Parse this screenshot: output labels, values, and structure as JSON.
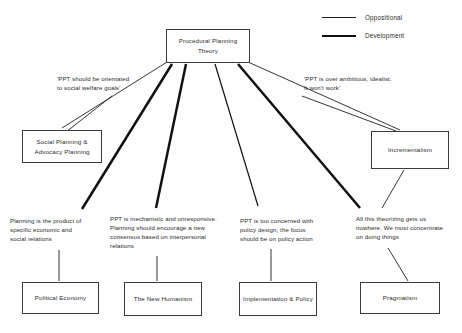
{
  "diagram": {
    "legend": {
      "items": [
        {
          "label": "Oppositional",
          "style": "thin-line",
          "color": "#1f1f1f"
        },
        {
          "label": "Development",
          "style": "thick-line",
          "color": "#111111"
        }
      ]
    },
    "root": {
      "label": "Procedural Planning\nTheory"
    },
    "notes": [
      {
        "id": "note-left",
        "text": "'PPT should be orientated\nto social welfare goals'"
      },
      {
        "id": "note-right",
        "text": "'PPT is over ambitious, idealist.\nIt won't work'"
      }
    ],
    "mid_nodes": [
      {
        "id": "social-planning",
        "label": "Social Planning &\nAdvocacy Planning"
      },
      {
        "id": "incrementalism",
        "label": "Incrementalism"
      }
    ],
    "critiques": [
      {
        "id": "critique-political-economy",
        "text": "Planning is the product of\nspecific economic and\nsocial relations"
      },
      {
        "id": "critique-new-humanism",
        "text": "PPT is mechanistic and unresponsive.\nPlanning should encourage a new\nconsensus based on interpersonal\nrelations"
      },
      {
        "id": "critique-implementation",
        "text": "PPT is too concerned with\npolicy design, the focus\nshould be on policy action"
      },
      {
        "id": "critique-pragmatism",
        "text": "All this theorizing gets us\nnowhere. We must concentrate\non doing things"
      }
    ],
    "outcomes": [
      {
        "id": "political-economy",
        "label": "Political Economy"
      },
      {
        "id": "new-humanism",
        "label": "The New\nHumanism"
      },
      {
        "id": "implementation-policy",
        "label": "Implementation\n& Policy"
      },
      {
        "id": "pragmatism",
        "label": "Pragmatism"
      }
    ],
    "colors": {
      "stroke": "#3a3a3a",
      "line_thin": "#1f1f1f",
      "line_thick": "#111111",
      "background": "#fefefe",
      "text": "#2b2b2b"
    }
  }
}
